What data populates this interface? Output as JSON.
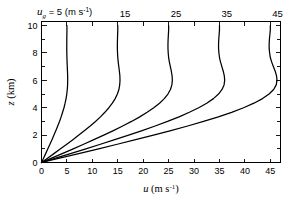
{
  "figure": {
    "background_color": "#ffffff",
    "line_color": "#000000"
  },
  "chart_data": {
    "type": "line",
    "title": "",
    "xlabel": "u  (m s⁻¹)",
    "ylabel": "z (km)",
    "xlim": [
      0,
      47
    ],
    "ylim": [
      0,
      10.3
    ],
    "grid": false,
    "legend_position": "top-inline-curve-labels",
    "x_ticks_major": [
      0,
      5,
      10,
      15,
      20,
      25,
      30,
      35,
      40,
      45
    ],
    "x_ticklabels": [
      "0",
      "5",
      "10",
      "15",
      "20",
      "25",
      "30",
      "35",
      "40",
      "45"
    ],
    "y_ticks_major": [
      0,
      2,
      4,
      6,
      8,
      10
    ],
    "y_ticklabels": [
      "0",
      "2",
      "4",
      "6",
      "8",
      "10"
    ],
    "y_ticks_minor": [
      1,
      3,
      5,
      7,
      9
    ],
    "top_annotation_prefix": "u",
    "top_annotation_subscript": "g",
    "top_annotation_equals": "= 5 (m s",
    "top_annotation_exp": "-1",
    "top_annotation_close": ")",
    "curve_labels": [
      "15",
      "25",
      "35",
      "45"
    ],
    "series": [
      {
        "name": "ug = 5 m/s",
        "asymptote": 5,
        "label": "5",
        "x": [
          0,
          0.42,
          0.84,
          1.25,
          1.66,
          2.06,
          2.45,
          2.83,
          3.19,
          3.54,
          3.86,
          4.15,
          4.42,
          4.64,
          4.83,
          4.97,
          5.07,
          5.13,
          5.15,
          5.14,
          5.11,
          5.07,
          5.03,
          5.0,
          4.98,
          4.97,
          4.97,
          4.98,
          4.99,
          5.0,
          5.0
        ],
        "y": [
          0,
          0.333,
          0.667,
          1.0,
          1.333,
          1.667,
          2.0,
          2.333,
          2.667,
          3.0,
          3.333,
          3.667,
          4.0,
          4.333,
          4.667,
          5.0,
          5.333,
          5.667,
          6.0,
          6.333,
          6.667,
          7.0,
          7.333,
          7.667,
          8.0,
          8.333,
          8.667,
          9.0,
          9.333,
          9.667,
          10.0
        ]
      },
      {
        "name": "ug = 15 m/s",
        "asymptote": 15,
        "label": "15",
        "x": [
          0,
          1.26,
          2.51,
          3.74,
          4.97,
          6.17,
          7.34,
          8.48,
          9.58,
          10.62,
          11.59,
          12.46,
          13.25,
          13.93,
          14.49,
          14.92,
          15.22,
          15.38,
          15.44,
          15.41,
          15.32,
          15.2,
          15.09,
          15.0,
          14.95,
          14.92,
          14.92,
          14.94,
          14.97,
          15.0,
          15.0
        ],
        "y": [
          0,
          0.333,
          0.667,
          1.0,
          1.333,
          1.667,
          2.0,
          2.333,
          2.667,
          3.0,
          3.333,
          3.667,
          4.0,
          4.333,
          4.667,
          5.0,
          5.333,
          5.667,
          6.0,
          6.333,
          6.667,
          7.0,
          7.333,
          7.667,
          8.0,
          8.333,
          8.667,
          9.0,
          9.333,
          9.667,
          10.0
        ]
      },
      {
        "name": "ug = 25 m/s",
        "asymptote": 25,
        "label": "25",
        "x": [
          0,
          2.09,
          4.18,
          6.24,
          8.28,
          10.29,
          12.24,
          14.14,
          15.96,
          17.7,
          19.32,
          20.77,
          22.08,
          23.21,
          24.15,
          24.86,
          25.36,
          25.64,
          25.73,
          25.68,
          25.53,
          25.34,
          25.15,
          25.0,
          24.92,
          24.87,
          24.87,
          24.9,
          24.95,
          25.0,
          25.0
        ],
        "y": [
          0,
          0.333,
          0.667,
          1.0,
          1.333,
          1.667,
          2.0,
          2.333,
          2.667,
          3.0,
          3.333,
          3.667,
          4.0,
          4.333,
          4.667,
          5.0,
          5.333,
          5.667,
          6.0,
          6.333,
          6.667,
          7.0,
          7.333,
          7.667,
          8.0,
          8.333,
          8.667,
          9.0,
          9.333,
          9.667,
          10.0
        ]
      },
      {
        "name": "ug = 35 m/s",
        "asymptote": 35,
        "label": "35",
        "x": [
          0,
          2.92,
          5.85,
          8.73,
          11.59,
          14.4,
          17.13,
          19.79,
          22.35,
          24.78,
          27.05,
          29.08,
          30.91,
          32.49,
          33.81,
          34.81,
          35.5,
          35.9,
          36.02,
          35.95,
          35.74,
          35.47,
          35.21,
          35.0,
          34.89,
          34.82,
          34.82,
          34.86,
          34.93,
          35.0,
          35.0
        ],
        "y": [
          0,
          0.333,
          0.667,
          1.0,
          1.333,
          1.667,
          2.0,
          2.333,
          2.667,
          3.0,
          3.333,
          3.667,
          4.0,
          4.333,
          4.667,
          5.0,
          5.333,
          5.667,
          6.0,
          6.333,
          6.667,
          7.0,
          7.333,
          7.667,
          8.0,
          8.333,
          8.667,
          9.0,
          9.333,
          9.667,
          10.0
        ]
      },
      {
        "name": "ug = 45 m/s",
        "asymptote": 45,
        "label": "45",
        "x": [
          0,
          3.76,
          7.52,
          11.23,
          14.9,
          18.51,
          22.02,
          25.44,
          28.74,
          31.86,
          34.78,
          37.39,
          39.74,
          41.77,
          43.47,
          44.75,
          45.65,
          46.16,
          46.31,
          46.22,
          45.96,
          45.61,
          45.27,
          45.0,
          44.86,
          44.77,
          44.77,
          44.82,
          44.91,
          45.0,
          45.0
        ],
        "y": [
          0,
          0.333,
          0.667,
          1.0,
          1.333,
          1.667,
          2.0,
          2.333,
          2.667,
          3.0,
          3.333,
          3.667,
          4.0,
          4.333,
          4.667,
          5.0,
          5.333,
          5.667,
          6.0,
          6.333,
          6.667,
          7.0,
          7.333,
          7.667,
          8.0,
          8.333,
          8.667,
          9.0,
          9.333,
          9.667,
          10.0
        ]
      }
    ]
  }
}
